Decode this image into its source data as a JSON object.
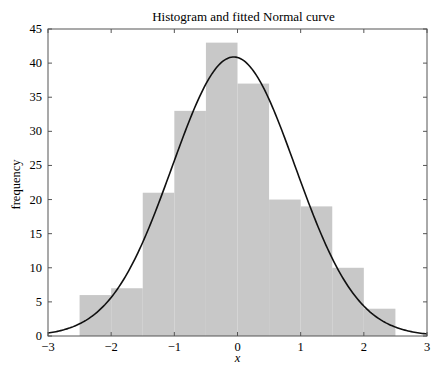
{
  "chart_data": {
    "type": "bar",
    "subtype": "histogram_with_fitted_curve",
    "title": "Histogram and fitted Normal curve",
    "xlabel": "x",
    "ylabel": "frequency",
    "xlim": [
      -3,
      3
    ],
    "ylim": [
      0,
      45
    ],
    "xticks": [
      -3,
      -2,
      -1,
      0,
      1,
      2,
      3
    ],
    "xtick_labels": [
      "−3",
      "−2",
      "−1",
      "0",
      "1",
      "2",
      "3"
    ],
    "yticks": [
      0,
      5,
      10,
      15,
      20,
      25,
      30,
      35,
      40,
      45
    ],
    "ytick_labels": [
      "0",
      "5",
      "10",
      "15",
      "20",
      "25",
      "30",
      "35",
      "40",
      "45"
    ],
    "grid": false,
    "legend": null,
    "bin_edges": [
      -2.5,
      -2.0,
      -1.5,
      -1.0,
      -0.5,
      0.0,
      0.5,
      1.0,
      1.5,
      2.0,
      2.5
    ],
    "values": [
      6,
      7,
      21,
      33,
      43,
      37,
      20,
      19,
      10,
      4
    ],
    "bar_color": "#c8c8c8",
    "curve": {
      "name": "fitted Normal curve",
      "mean": -0.06,
      "sd": 0.975,
      "peak": 40.9,
      "color": "#111111"
    }
  }
}
